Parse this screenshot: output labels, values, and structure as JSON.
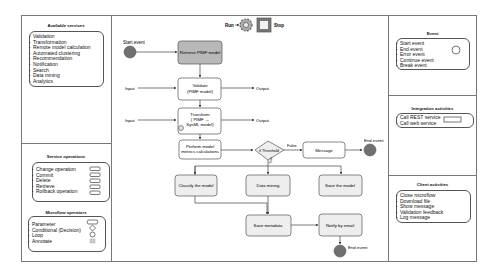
{
  "toolbar": {
    "run_label": "Run",
    "stop_label": "Stop"
  },
  "left_panel": {
    "available_services": {
      "title": "Available services",
      "items": [
        "Validation",
        "Transformation",
        "Remote model calculation",
        "Automated clustering",
        "Recommendation",
        "Notification",
        "Search",
        "Data mining",
        "Analytics"
      ]
    },
    "service_operations": {
      "title": "Service operations",
      "items": [
        "Change operation",
        "Commit",
        "Delete",
        "Retrieve",
        "Rollback operation"
      ]
    },
    "microflow_operators": {
      "title": "Microflow operators",
      "items": [
        "Parameter",
        "Conditional (Decision)",
        "Loop",
        "Annotate"
      ]
    }
  },
  "right_panel": {
    "event": {
      "title": "Event",
      "items": [
        "Start event",
        "End event",
        "Error event",
        "Continue event",
        "Break event"
      ]
    },
    "integration_activities": {
      "title": "Integration activities",
      "items": [
        "Call REST service",
        "Call web service"
      ]
    },
    "client_activities": {
      "title": "Client activities",
      "items": [
        "Close microflow",
        "Download file",
        "Show message",
        "Validation feedback",
        "Log  message"
      ]
    }
  },
  "diagram": {
    "start_event": "Start event",
    "end_event_1": "End event",
    "end_event_2": "End event",
    "nodes": {
      "retrieve": "Retrieve PIMF model",
      "validate": [
        "Validate",
        "(PIMF model)"
      ],
      "transform": [
        "Transform",
        "( PIMF →",
        "SysML model)"
      ],
      "perform": [
        "Perform model",
        "metrics calculations"
      ],
      "decision": "if Threshold",
      "message": "Message",
      "classify": "Classify the model",
      "data_mining": "Data mining",
      "save_model": "Save the model",
      "save_metadata": "Save metadata",
      "notify": "Notify by email"
    },
    "labels": {
      "input_1": "Input",
      "input_2": "Input",
      "output_1": "Output",
      "output_2": "Output",
      "false": "False",
      "true": "True"
    }
  },
  "colors": {
    "event_fill": "#707070",
    "retrieve_fill": "#b8b8b8",
    "activity_fill": "#eeeeee",
    "border": "#555555"
  }
}
